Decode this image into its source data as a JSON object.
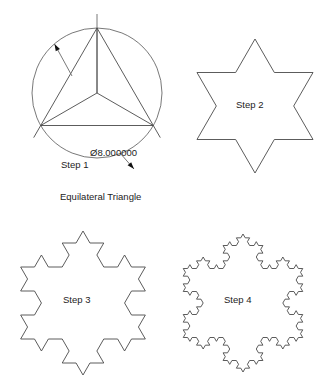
{
  "figure": {
    "background_color": "#ffffff",
    "line_color": "#4a4a4a",
    "text_color": "#1c1c1c"
  },
  "panels": [
    {
      "id": "step1",
      "label": "Step 1",
      "caption": "Equilateral Triangle",
      "dimension_label": "Ø8.000000",
      "dimension_symbol": "Ø",
      "dimension_value": "8.000000",
      "shape": "circumscribed-circle-with-equilateral-triangle",
      "koch_iteration": 0,
      "geometry": {
        "center_x": 97,
        "center_y": 93,
        "radius": 65,
        "triangle_vertices": [
          {
            "x": 97,
            "y": 28
          },
          {
            "x": 40.7,
            "y": 125.5
          },
          {
            "x": 153.3,
            "y": 125.5
          }
        ],
        "centerline_top_y": 14,
        "radii_drawn": true,
        "extension_overrun": 14
      },
      "leaders": [
        {
          "name": "radius-leader",
          "from_x": 72,
          "from_y": 76,
          "to_x": 54.5,
          "to_y": 44,
          "arrow_at": "to"
        },
        {
          "name": "diameter-leader",
          "from_x": 120,
          "from_y": 153,
          "to_x": 134,
          "to_y": 169,
          "arrow_at": "to"
        }
      ]
    },
    {
      "id": "step2",
      "label": "Step 2",
      "shape": "koch-snowflake",
      "koch_iteration": 1,
      "geometry": {
        "center_x": 255,
        "center_y": 106,
        "radius": 67
      }
    },
    {
      "id": "step3",
      "label": "Step 3",
      "shape": "koch-snowflake",
      "koch_iteration": 2,
      "geometry": {
        "center_x": 83,
        "center_y": 303,
        "radius": 72
      }
    },
    {
      "id": "step4",
      "label": "Step 4",
      "shape": "koch-snowflake",
      "koch_iteration": 3,
      "geometry": {
        "center_x": 243,
        "center_y": 303,
        "radius": 69
      }
    }
  ]
}
